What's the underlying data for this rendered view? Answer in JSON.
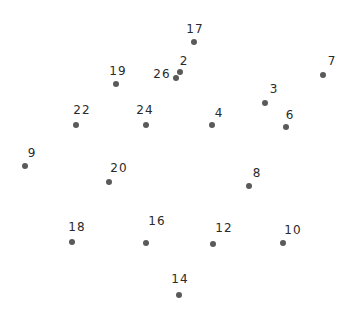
{
  "puzzle": {
    "type": "connect-the-dots",
    "dot_color": "#5a5a5a",
    "label_color": "#2a2a2a",
    "background": "#ffffff",
    "points": [
      {
        "n": "17",
        "x": 194,
        "y": 42,
        "lx": 195,
        "ly": 29
      },
      {
        "n": "2",
        "x": 180,
        "y": 72,
        "lx": 184,
        "ly": 61
      },
      {
        "n": "26",
        "x": 176,
        "y": 78,
        "lx": 162,
        "ly": 74
      },
      {
        "n": "19",
        "x": 116,
        "y": 84,
        "lx": 118,
        "ly": 71
      },
      {
        "n": "7",
        "x": 323,
        "y": 75,
        "lx": 332,
        "ly": 61
      },
      {
        "n": "3",
        "x": 265,
        "y": 103,
        "lx": 274,
        "ly": 89
      },
      {
        "n": "22",
        "x": 76,
        "y": 125,
        "lx": 82,
        "ly": 110
      },
      {
        "n": "24",
        "x": 146,
        "y": 125,
        "lx": 145,
        "ly": 110
      },
      {
        "n": "4",
        "x": 212,
        "y": 125,
        "lx": 219,
        "ly": 113
      },
      {
        "n": "6",
        "x": 286,
        "y": 127,
        "lx": 290,
        "ly": 115
      },
      {
        "n": "9",
        "x": 25,
        "y": 166,
        "lx": 32,
        "ly": 153
      },
      {
        "n": "20",
        "x": 109,
        "y": 182,
        "lx": 119,
        "ly": 168
      },
      {
        "n": "8",
        "x": 249,
        "y": 186,
        "lx": 257,
        "ly": 173
      },
      {
        "n": "18",
        "x": 72,
        "y": 242,
        "lx": 77,
        "ly": 227
      },
      {
        "n": "16",
        "x": 146,
        "y": 243,
        "lx": 157,
        "ly": 221
      },
      {
        "n": "12",
        "x": 213,
        "y": 244,
        "lx": 224,
        "ly": 228
      },
      {
        "n": "10",
        "x": 283,
        "y": 243,
        "lx": 293,
        "ly": 230
      },
      {
        "n": "14",
        "x": 179,
        "y": 295,
        "lx": 180,
        "ly": 279
      }
    ]
  }
}
